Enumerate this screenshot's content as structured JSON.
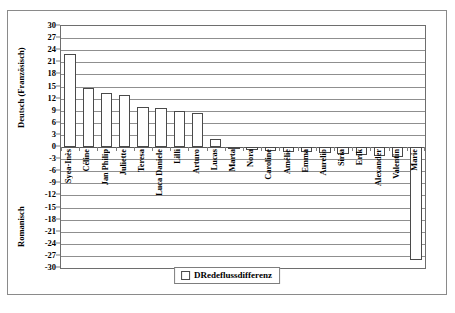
{
  "chart_data": {
    "type": "bar",
    "title": "",
    "xlabel": "",
    "ylabel_top": "Deutsch (Französisch)",
    "ylabel_bottom": "Romanisch",
    "ylim": [
      -30,
      30
    ],
    "ytick_step": 3,
    "yticks": [
      30,
      27,
      24,
      21,
      18,
      15,
      12,
      9,
      6,
      3,
      0,
      -3,
      -6,
      -9,
      -12,
      -15,
      -18,
      -21,
      -24,
      -27,
      -30
    ],
    "grid": true,
    "legend_position": "bottom-center",
    "legend": [
      "DRedeflussdifferenz"
    ],
    "categories": [
      "Syea-Inès",
      "Céline",
      "Jan Philip",
      "Juliette",
      "Teresa",
      "Luca Daniele",
      "Lilli",
      "Arturo",
      "Lucas",
      "Marta",
      "Nora",
      "Caroline",
      "Amélie",
      "Emma",
      "Aurelio",
      "Siria",
      "Erik",
      "Alexander",
      "Valentin",
      "Marie"
    ],
    "values": [
      23,
      14.7,
      13.4,
      13,
      10,
      9.7,
      9,
      8.5,
      2,
      -0.6,
      -0.8,
      -1,
      -1.2,
      -1.3,
      -1.5,
      -1.7,
      -1.9,
      -2.2,
      -2.6,
      -28
    ]
  },
  "legend_swatch_icon": "square-outline-icon"
}
